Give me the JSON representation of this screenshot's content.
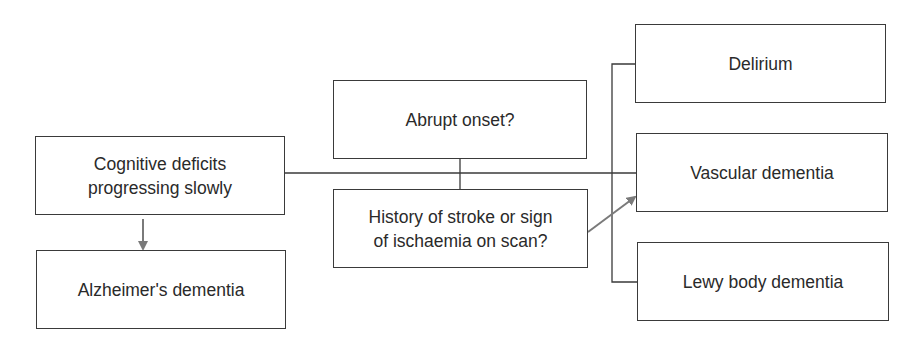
{
  "diagram": {
    "nodes": {
      "cognitive": {
        "line1": "Cognitive deficits",
        "line2": "progressing slowly"
      },
      "alzheimers": {
        "label": "Alzheimer's dementia"
      },
      "abrupt": {
        "label": "Abrupt onset?"
      },
      "history": {
        "line1": "History of stroke or sign",
        "line2": "of ischaemia on scan?"
      },
      "delirium": {
        "label": "Delirium"
      },
      "vascular": {
        "label": "Vascular dementia"
      },
      "lewy": {
        "label": "Lewy body dementia"
      }
    },
    "edges": [
      {
        "from": "cognitive",
        "to": "alzheimers",
        "style": "arrow",
        "color": "#7a7a7a"
      },
      {
        "from": "cognitive",
        "to": "vascular",
        "style": "line",
        "color": "#3a3a3a"
      },
      {
        "from": "abrupt",
        "to": "history",
        "style": "line",
        "color": "#3a3a3a"
      },
      {
        "from": "history",
        "to": "vascular",
        "style": "arrow",
        "color": "#7a7a7a"
      },
      {
        "from": "bracket",
        "to": [
          "delirium",
          "vascular",
          "lewy"
        ],
        "style": "bracket",
        "color": "#3a3a3a"
      }
    ],
    "colors": {
      "line": "#3a3a3a",
      "arrow": "#7a7a7a",
      "background": "#ffffff"
    }
  }
}
